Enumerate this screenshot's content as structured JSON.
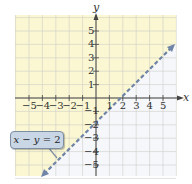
{
  "chart_data": {
    "type": "line",
    "title": "",
    "xlabel": "x",
    "ylabel": "y",
    "xlim": [
      -6,
      6
    ],
    "ylim": [
      -6,
      6
    ],
    "x_ticks": [
      -5,
      -4,
      -3,
      -2,
      -1,
      1,
      2,
      3,
      4,
      5
    ],
    "y_ticks": [
      -5,
      -4,
      -3,
      -2,
      -1,
      1,
      2,
      3,
      4,
      5
    ],
    "grid": true,
    "series": [
      {
        "name": "x - y = 2",
        "style": "dashed",
        "points": [
          [
            -4,
            -6
          ],
          [
            6,
            4
          ]
        ],
        "equation": "y = x - 2"
      }
    ],
    "shaded_region": {
      "inequality": "x - y < 2",
      "side": "above-left",
      "color": "#faf7d2"
    },
    "unshaded_color": "#f5f7fb",
    "line_color": "#6f84a6",
    "annotation": {
      "text": "x − y = 2",
      "position": [
        -4.5,
        -2.8
      ]
    }
  },
  "labels": {
    "x_axis": "x",
    "y_axis": "y",
    "callout_lhs_x": "x",
    "callout_minus": " − ",
    "callout_y": "y",
    "callout_rhs": " = 2"
  }
}
